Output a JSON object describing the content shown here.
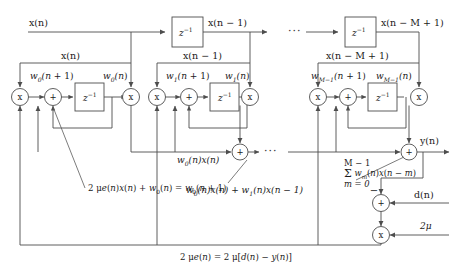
{
  "figure": {
    "type": "block-diagram",
    "background": "#ffffff",
    "line_color": "#4d4d4d",
    "text_color": "#1a1a1a"
  },
  "delay_line": {
    "input_label": "x(n)",
    "delay_blocks": [
      {
        "label": "z",
        "exponent": "-1",
        "output_label": "x(n − 1)"
      },
      {
        "label": "z",
        "exponent": "-1",
        "output_label": "x(n − M + 1)"
      }
    ],
    "ellipsis": "···"
  },
  "taps": [
    {
      "index": 0,
      "input_label": "x(n)",
      "weight_next_label": "w0(n + 1)",
      "weight_next_parts": {
        "base": "w",
        "sub": "0",
        "rest": "(n + 1)"
      },
      "weight_label": "w0(n)",
      "weight_parts": {
        "base": "w",
        "sub": "0",
        "rest": "(n)"
      },
      "multiplier_symbol": "x",
      "adder_symbol": "+",
      "delay_label": "z",
      "delay_exponent": "-1",
      "product_label": "w0(n)x(n)",
      "update_equation": "2 μe(n)x(n) + w0(n) = w0(n + 1)"
    },
    {
      "index": 1,
      "input_label": "x(n − 1)",
      "weight_next_label": "w1(n + 1)",
      "weight_next_parts": {
        "base": "w",
        "sub": "1",
        "rest": "(n + 1)"
      },
      "weight_label": "w1(n)",
      "weight_parts": {
        "base": "w",
        "sub": "1",
        "rest": "(n)"
      },
      "multiplier_symbol": "x",
      "adder_symbol": "+",
      "delay_label": "z",
      "delay_exponent": "-1",
      "product_label": "w0(n)x(n) + w1(n)x(n − 1)"
    },
    {
      "index": 2,
      "input_label": "x(n − M + 1)",
      "weight_next_label": "wM-1(n + 1)",
      "weight_next_parts": {
        "base": "w",
        "sub": "M−1",
        "rest": "(n + 1)"
      },
      "weight_label": "wM-1(n)",
      "weight_parts": {
        "base": "w",
        "sub": "M−1",
        "rest": "(n)"
      },
      "multiplier_symbol": "x",
      "adder_symbol": "+",
      "delay_label": "z",
      "delay_exponent": "-1"
    }
  ],
  "summation": {
    "adder_symbol": "+",
    "ellipsis": "···",
    "output_adder_symbol": "+",
    "output_label": "y(n)",
    "sum_expression": {
      "upper": "M − 1",
      "sigma": "Σ",
      "body": "wm(n)x(n − m)",
      "lower": "m = 0"
    }
  },
  "error_path": {
    "adder_symbol": "+",
    "minus_sign": "−",
    "desired_label": "d(n)",
    "multiplier_symbol": "x",
    "gain_label": "2μ",
    "error_equation": "2 μe(n) = 2 μ[d(n) − y(n)]"
  }
}
